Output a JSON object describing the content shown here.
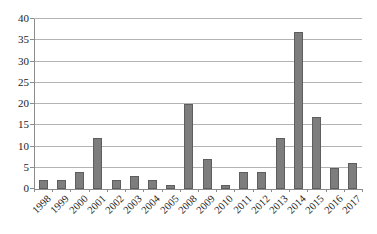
{
  "chart_data": {
    "type": "bar",
    "title": "",
    "xlabel": "",
    "ylabel": "",
    "categories": [
      "1998",
      "1999",
      "2000",
      "2001",
      "2002",
      "2003",
      "2004",
      "2005",
      "2008",
      "2009",
      "2010",
      "2011",
      "2012",
      "2013",
      "2014",
      "2015",
      "2016",
      "2017"
    ],
    "values": [
      2,
      2,
      4,
      12,
      2,
      3,
      2,
      1,
      20,
      7,
      1,
      4,
      4,
      12,
      37,
      17,
      5,
      6
    ],
    "ylim": [
      0,
      40
    ],
    "yticks": [
      0,
      5,
      10,
      15,
      20,
      25,
      30,
      35,
      40
    ],
    "grid": true,
    "legend": "none",
    "series_name": "",
    "colors": {
      "bar_fill": "#7d7d7d",
      "bar_border": "#5e5e5e",
      "gridline": "#b3b3b3",
      "axis": "#8c8c8c",
      "tick": "#8c8c8c",
      "label_text": "#1a1a1a",
      "background": "#ffffff"
    }
  }
}
